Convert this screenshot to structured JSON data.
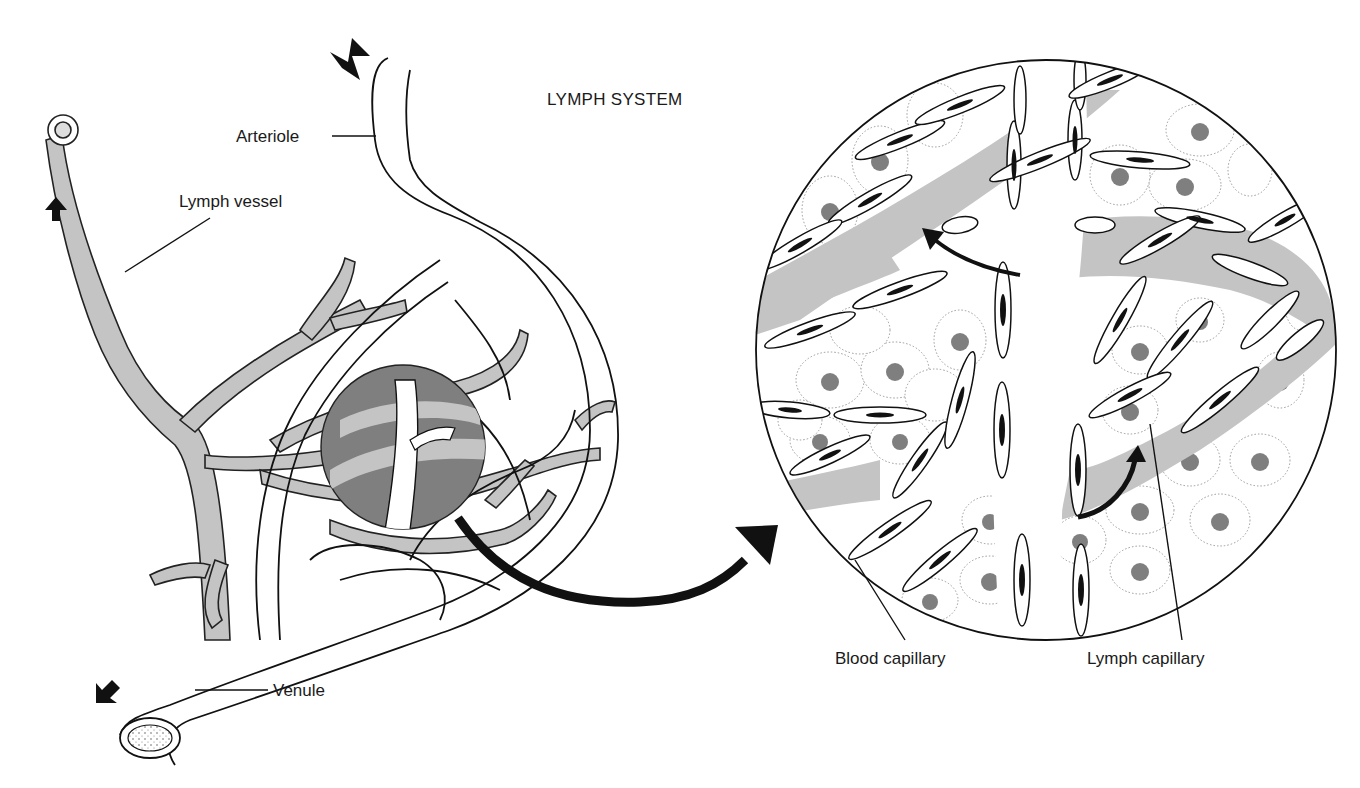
{
  "figure": {
    "title": "LYMPH SYSTEM",
    "labels": {
      "arteriole": "Arteriole",
      "lymph_vessel": "Lymph vessel",
      "venule": "Venule",
      "blood_capillary": "Blood capillary",
      "lymph_capillary": "Lymph capillary"
    },
    "icons": {
      "flow_arrow_in": "arrow-down-left-icon",
      "flow_arrow_lymph": "arrow-up-icon",
      "flow_arrow_out": "arrow-down-left-icon",
      "magnify_arrow": "curved-arrow-right-icon",
      "lymph_entry_arrows": "curved-arrow-up-icon"
    },
    "colors": {
      "background": "#ffffff",
      "outline": "#111111",
      "lymph_grey": "#c4c4c4",
      "magnified_region": "#7f7f7f",
      "blood_vessel_fill": "#ffffff"
    }
  }
}
